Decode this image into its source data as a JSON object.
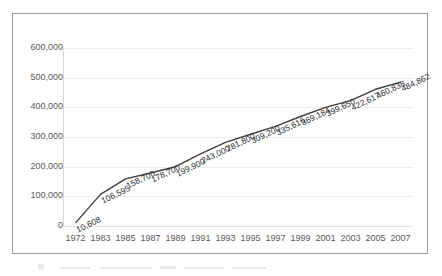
{
  "chart_data": {
    "type": "line",
    "title": "",
    "subtitle": "",
    "xlabel": "",
    "ylabel": "",
    "ylim": [
      0,
      600000
    ],
    "y_ticks": [
      "0",
      "100,000",
      "200,000",
      "300,000",
      "400,000",
      "500,000",
      "600,000"
    ],
    "y_tick_values": [
      0,
      100000,
      200000,
      300000,
      400000,
      500000,
      600000
    ],
    "grid": true,
    "legend": "none",
    "categories": [
      "1972",
      "1983",
      "1985",
      "1987",
      "1989",
      "1991",
      "1993",
      "1995",
      "1997",
      "1999",
      "2001",
      "2003",
      "2005",
      "2007"
    ],
    "x_tick_labels": [
      "1972",
      "1983",
      "1985",
      "1987",
      "1989",
      "1991",
      "1993",
      "1995",
      "1997",
      "1999",
      "2001",
      "2003",
      "2005",
      "2007"
    ],
    "values": [
      10608,
      106595,
      158700,
      178700,
      199900,
      243000,
      281800,
      309200,
      335616,
      369184,
      399650,
      422617,
      460838,
      484862
    ],
    "data_labels": [
      "10,608",
      "106,595",
      "158,700",
      "178,700",
      "199,900",
      "243,000",
      "281,800",
      "309,200",
      "335,616",
      "369,184",
      "399,650",
      "422,617",
      "460,838",
      "484,862"
    ],
    "series_color": "#3f3f41",
    "grid_color": "#ececed",
    "axis_text_color": "#59595b",
    "label_text_color": "#2b2b2d",
    "frame_color": "#9a9a9a"
  }
}
